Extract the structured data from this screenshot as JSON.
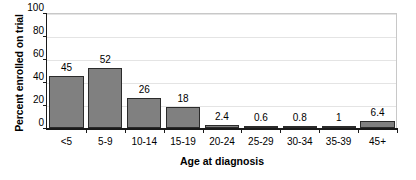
{
  "chart_data": {
    "type": "bar",
    "title": "",
    "subtitle": "",
    "xlabel": "Age at diagnosis",
    "ylabel": "Percent enrolled on trial",
    "categories": [
      "<5",
      "5-9",
      "10-14",
      "15-19",
      "20-24",
      "25-29",
      "30-34",
      "35-39",
      "45+"
    ],
    "values": [
      45,
      52,
      26,
      18,
      2.4,
      0.6,
      0.8,
      1,
      6.4
    ],
    "value_labels": [
      "45",
      "52",
      "26",
      "18",
      "2.4",
      "0.6",
      "0.8",
      "1",
      "6.4"
    ],
    "ylim": [
      0,
      100
    ],
    "ytick_labels": [
      "0",
      "20",
      "40",
      "60",
      "80",
      "100"
    ],
    "ytick_values": [
      0,
      20,
      40,
      60,
      80,
      100
    ],
    "grid": "horizontal",
    "legend": "none",
    "bar_color": "#808080",
    "bar_edge_color": "#2b2b2b",
    "axis_color": "#1a1a1a",
    "gridline_color": "#e4e4e4",
    "frame_color": "#c8c8c8",
    "background_color": "#ffffff"
  }
}
